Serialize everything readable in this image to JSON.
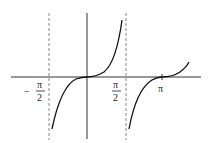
{
  "diagram": {
    "type": "function-graph",
    "labels": {
      "neg_half_pi": {
        "sign": "−",
        "num": "π",
        "den": "2"
      },
      "half_pi": {
        "num": "π",
        "den": "2"
      },
      "pi": "π"
    },
    "colors": {
      "axis": "#333333",
      "curve": "#111111",
      "asymptote": "#888888"
    }
  }
}
